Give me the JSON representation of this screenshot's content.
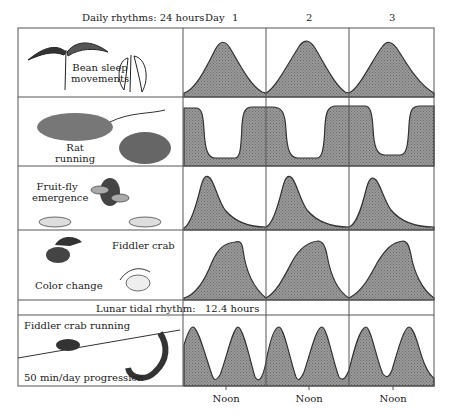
{
  "header": {
    "daily_label": "Daily rhythms: 24 hours",
    "day_prefix": "Day",
    "days": [
      "1",
      "2",
      "3"
    ]
  },
  "rows": [
    {
      "id": "bean",
      "label_lines": [
        "Bean sleep",
        "movements"
      ],
      "illustration": "bean-plant-icon"
    },
    {
      "id": "rat",
      "label_lines": [
        "Rat",
        "running"
      ],
      "illustration": "rat-icon"
    },
    {
      "id": "fruitfly",
      "label_lines": [
        "Fruit-fly",
        "emergence"
      ],
      "illustration": "fruit-fly-icon"
    },
    {
      "id": "crab-color",
      "label_title": "Fiddler crab",
      "label_sub": "Color change",
      "illustration": "fiddler-crab-icon"
    },
    {
      "id": "crab-running",
      "label_title": "Fiddler crab running",
      "label_sub": "50 min/day progression",
      "illustration": "crab-burrow-icon"
    }
  ],
  "tidal": {
    "label": "Lunar tidal rhythm:",
    "period": "12.4 hours"
  },
  "footer": {
    "noon_labels": [
      "Noon",
      "Noon",
      "Noon"
    ]
  },
  "colors": {
    "fill": "#8c8c8c",
    "line": "#333333",
    "grid": "#555555"
  }
}
